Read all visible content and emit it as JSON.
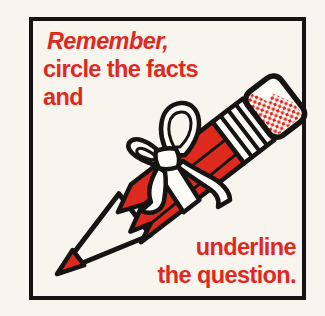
{
  "card": {
    "top_text": {
      "line1": "Remember,",
      "line2": "circle the facts",
      "line3": "and"
    },
    "bottom_text": {
      "line1": "underline",
      "line2": "the question."
    },
    "illustration_alt": "red cartoon pencil with sharpened tip, striped ferrule, halftone-dotted eraser, tied with a white ribbon bow"
  },
  "colors": {
    "red": "#de2a1e",
    "paper": "#f7f5ee",
    "ink": "#151413",
    "ribbon": "#fdfcf8"
  }
}
